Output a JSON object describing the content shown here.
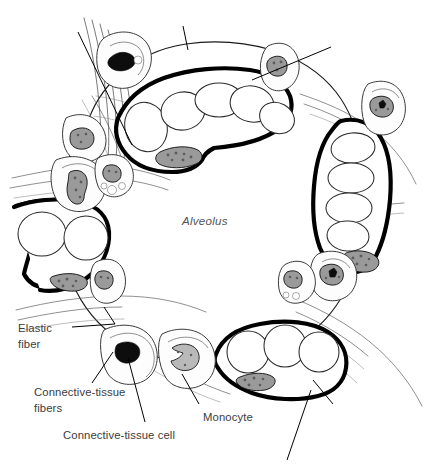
{
  "figure": {
    "title": "Alveolus",
    "background_color": "#ffffff",
    "ink_color": "#000000",
    "label_color": "#3c3c3c",
    "lumen_label_color": "#555555"
  },
  "lumen": {
    "label": "Alveolus",
    "x": 210,
    "y": 221
  },
  "labels": [
    {
      "id": "elastic-fiber",
      "lines": [
        "Elastic",
        "fiber"
      ],
      "line1": "Elastic",
      "line2": "fiber",
      "x": 18,
      "y": 321
    },
    {
      "id": "connective-tissue-fibers",
      "lines": [
        "Connective-tissue",
        "fibers"
      ],
      "line1": "Connective-tissue",
      "line2": "fibers",
      "x": 34,
      "y": 385
    },
    {
      "id": "connective-tissue-cell",
      "lines": [
        "Connective-tissue cell"
      ],
      "line1": "Connective-tissue cell",
      "line2": "",
      "x": 63,
      "y": 428
    },
    {
      "id": "monocyte",
      "lines": [
        "Monocyte"
      ],
      "line1": "Monocyte",
      "line2": "",
      "x": 203,
      "y": 410
    }
  ],
  "leader_lines": [
    {
      "id": "elastic-fiber-leader",
      "labelled": true,
      "from": [
        72,
        327
      ],
      "to": [
        115,
        324
      ]
    },
    {
      "id": "elastic-fiber-leader-upper",
      "labelled": true,
      "from": [
        115,
        324
      ],
      "to": [
        104,
        309
      ]
    },
    {
      "id": "connective-tissue-fibers-leader",
      "labelled": true,
      "from": [
        92,
        383
      ],
      "to": [
        113,
        352
      ]
    },
    {
      "id": "connective-tissue-cell-leader",
      "labelled": true,
      "from": [
        145,
        422
      ],
      "to": [
        128,
        358
      ]
    },
    {
      "id": "monocyte-leader",
      "labelled": true,
      "from": [
        199,
        404
      ],
      "to": [
        182,
        374
      ]
    },
    {
      "id": "unlabelled-leader-top-left",
      "labelled": false,
      "from": [
        78,
        32
      ],
      "to": [
        132,
        145
      ]
    },
    {
      "id": "unlabelled-leader-top-center",
      "labelled": false,
      "from": [
        183,
        26
      ],
      "to": [
        188,
        50
      ]
    },
    {
      "id": "unlabelled-leader-top-right",
      "labelled": false,
      "from": [
        331,
        47
      ],
      "to": [
        252,
        80
      ]
    },
    {
      "id": "unlabelled-leader-bottom-right",
      "labelled": false,
      "from": [
        333,
        404
      ],
      "to": [
        313,
        380
      ]
    },
    {
      "id": "unlabelled-leader-bottom-far-right",
      "labelled": false,
      "from": [
        287,
        460
      ],
      "to": [
        311,
        390
      ]
    }
  ],
  "capillaries": [
    {
      "id": "capillary-top",
      "erythrocyte_count": 5,
      "has_endothelial_nucleus": true
    },
    {
      "id": "capillary-right",
      "erythrocyte_count": 4,
      "has_endothelial_nucleus": true
    },
    {
      "id": "capillary-left",
      "erythrocyte_count": 2,
      "has_endothelial_nucleus": true
    },
    {
      "id": "capillary-bottom-right",
      "erythrocyte_count": 3,
      "has_endothelial_nucleus": true
    }
  ],
  "cells": [
    {
      "id": "cell-upper-left",
      "nucleus": "dark-lobed"
    },
    {
      "id": "cell-left-upper",
      "nucleus": "mottled"
    },
    {
      "id": "cell-left-mid",
      "nucleus": "mottled-lobed"
    },
    {
      "id": "cell-left-granular",
      "nucleus": "granular"
    },
    {
      "id": "cell-top-right",
      "nucleus": "mottled"
    },
    {
      "id": "cell-right-upper",
      "nucleus": "dark-stellate"
    },
    {
      "id": "cell-right-lower",
      "nucleus": "dark-stellate"
    },
    {
      "id": "cell-right-granular",
      "nucleus": "granular"
    },
    {
      "id": "cell-lower-left-septum",
      "nucleus": "mottled"
    },
    {
      "id": "connective-tissue-cell",
      "nucleus": "dark-angular"
    },
    {
      "id": "monocyte",
      "nucleus": "kidney-shaped"
    }
  ],
  "structures": {
    "elastic_fiber_bundle": "upper-left thin parallel strands",
    "connective_tissue_fibers": "wispy strands through septa"
  }
}
